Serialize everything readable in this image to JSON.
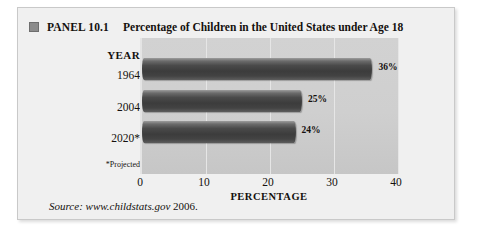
{
  "panel": {
    "marker_icon": "filled-square-icon",
    "number": "PANEL 10.1",
    "title": "Percentage of Children in the United States under Age 18"
  },
  "axes": {
    "y_header": "YEAR",
    "y_footnote": "*Projected",
    "x_title": "PERCENTAGE"
  },
  "source": {
    "label": "Source: www.childstats.gov",
    "year": "2006."
  },
  "colors": {
    "panel_background": "#f0f0f0",
    "plot_background": "#cfcfcf",
    "bar_dark": "#3c3c3c",
    "bar_light": "#9c9c9c",
    "gridline": "#e6e6e6",
    "marker": "#8c8c8c",
    "text": "#14100e"
  },
  "chart_data": {
    "type": "bar",
    "orientation": "horizontal",
    "title": "Percentage of Children in the United States under Age 18",
    "xlabel": "PERCENTAGE",
    "ylabel": "YEAR",
    "categories": [
      "1964",
      "2004",
      "2020*"
    ],
    "values": [
      36,
      25,
      24
    ],
    "value_labels": [
      "36%",
      "25%",
      "24%"
    ],
    "xlim": [
      0,
      40
    ],
    "xticks": [
      0,
      10,
      20,
      30,
      40
    ],
    "xtick_labels": [
      "0",
      "10",
      "20",
      "30",
      "40"
    ],
    "grid": true,
    "grid_axis": "x",
    "legend": false,
    "annotations": [
      "*Projected"
    ],
    "source": "Source: www.childstats.gov 2006."
  }
}
